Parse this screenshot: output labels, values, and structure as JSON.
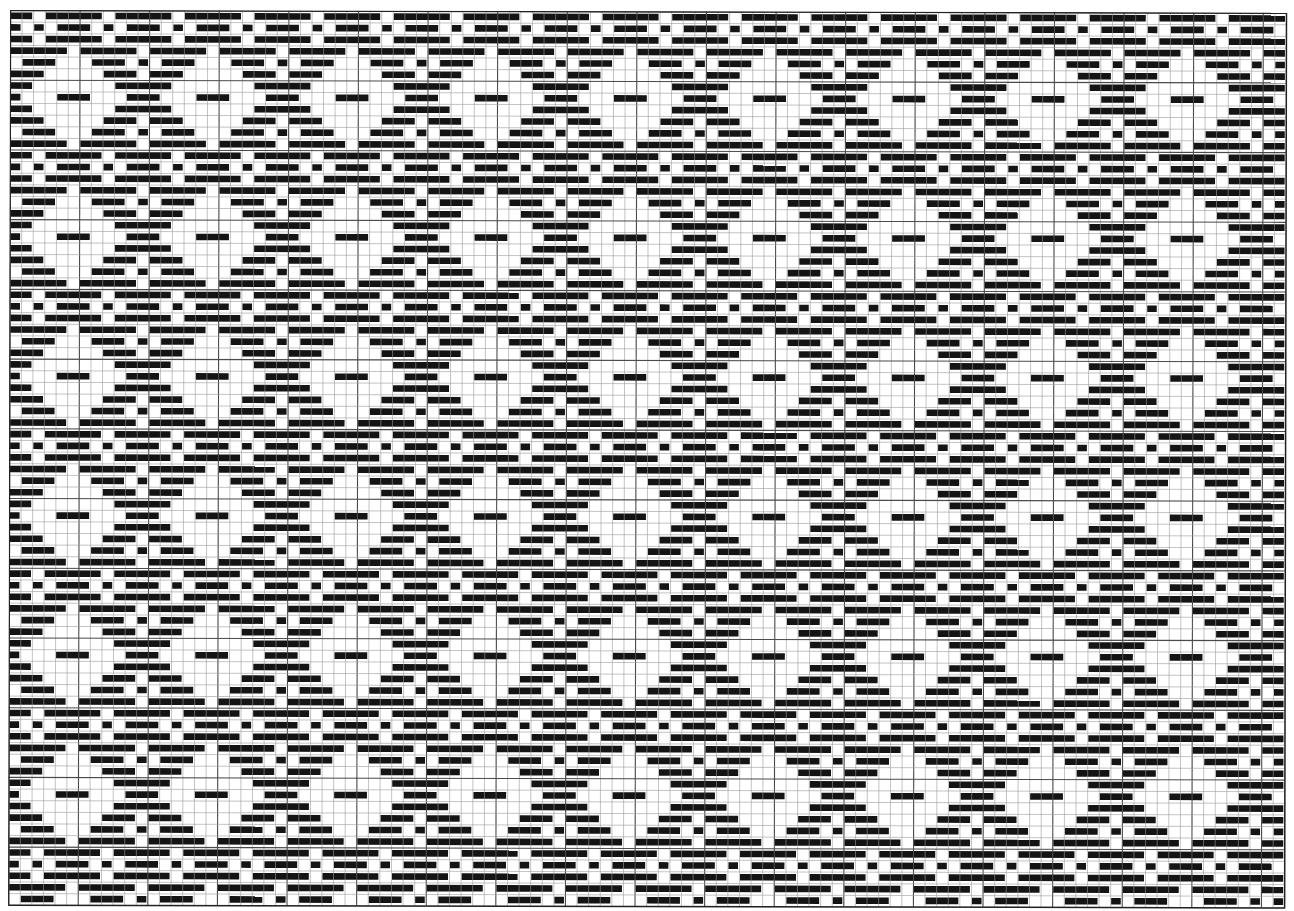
{
  "draft": {
    "title": "Weaving draft grid pattern",
    "cols": 110,
    "rows": 77,
    "cell_width": 11.6,
    "cell_height": 11.62,
    "major_every": 6,
    "colors": {
      "filled": "#141414",
      "empty": "#ffffff",
      "minor_line": "#9a9a9a",
      "major_line": "#4a4a4a",
      "border": "#222222"
    },
    "tile": [
      "110111110111",
      "101011101011",
      "110111110111",
      "111110111110",
      "011100011101",
      "111000001110",
      "110000000111",
      "100011100011",
      "110000000111",
      "111000001110",
      "011100011101",
      "111110111110"
    ],
    "tile_offset_row": 0,
    "tile_offset_col": 0
  }
}
